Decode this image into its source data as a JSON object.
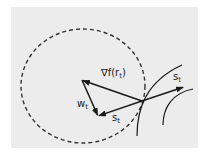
{
  "diagram": {
    "background_color": "#ececec",
    "stroke_color": "#1a1a1a",
    "trust_region": {
      "shape": "dashed-circle",
      "cx": 83,
      "cy": 86,
      "rx": 62,
      "ry": 57
    },
    "labels": {
      "gradient": {
        "main": "∇f(r",
        "sub": "t",
        "close": ")"
      },
      "w": {
        "main": "w",
        "sub": "t"
      },
      "s_lower": {
        "main": "s",
        "sub": "t"
      },
      "s_upper": {
        "main": "s",
        "sub": "t"
      }
    },
    "points": {
      "origin": [
        142,
        101
      ],
      "gradient_tip": [
        82,
        80
      ],
      "lower_vertex": [
        98,
        116
      ],
      "s_upper_tip": [
        184,
        87
      ]
    },
    "vectors": [
      {
        "name": "gradient",
        "from": "origin",
        "to": "gradient_tip",
        "label": "∇f(r_t)"
      },
      {
        "name": "w",
        "from": "gradient_tip",
        "to": "lower_vertex",
        "label": "w_t"
      },
      {
        "name": "s-lower",
        "from": "origin",
        "to": "lower_vertex",
        "label": "s_t"
      },
      {
        "name": "s-upper",
        "from": "origin",
        "to": "s_upper_tip",
        "label": "s_t"
      }
    ],
    "curves": [
      {
        "name": "level-curve-inner"
      },
      {
        "name": "level-curve-outer"
      }
    ]
  }
}
